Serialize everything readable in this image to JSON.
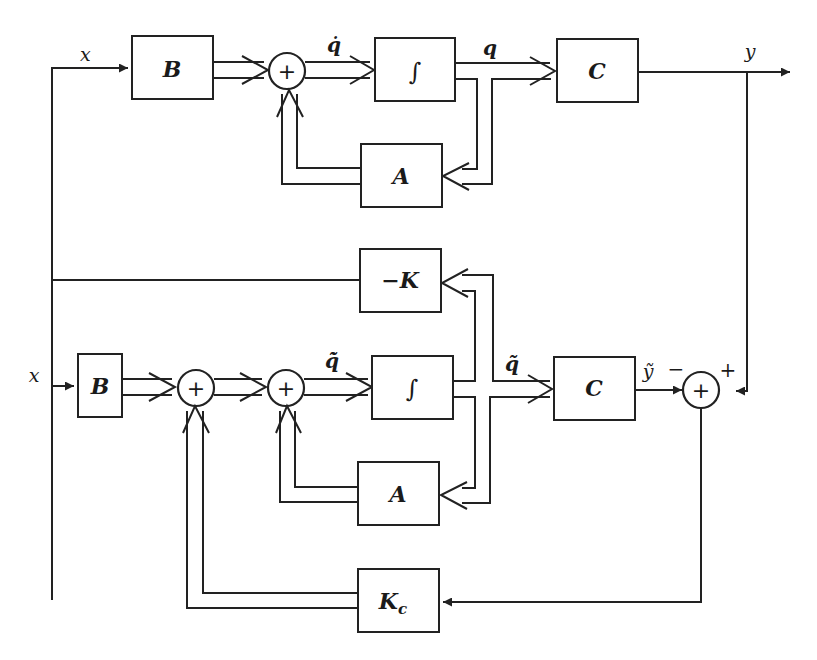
{
  "diagram": {
    "type": "block-diagram",
    "colors": {
      "stroke": "#222222",
      "background": "#ffffff"
    },
    "plant": {
      "input_label": "x",
      "B": "B",
      "sum": "+",
      "qdot": "q̇",
      "integrator": "∫",
      "q": "q",
      "C": "C",
      "A": "A",
      "output_label": "y"
    },
    "feedback_gain": "−K",
    "observer": {
      "input_label": "x",
      "B": "B",
      "sum1": "+",
      "sum2": "+",
      "qtilde_dot": "q̃̇",
      "integrator": "∫",
      "qtilde": "q̃",
      "C": "C",
      "A": "A",
      "ytilde": "ỹ",
      "Kc": "K",
      "Kc_sub": "c"
    },
    "error_sum": {
      "symbol": "+",
      "minus_sign": "−",
      "plus_sign": "+"
    }
  }
}
